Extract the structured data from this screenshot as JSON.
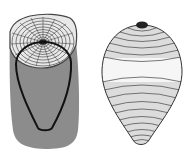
{
  "diagram": {
    "panels": [
      {
        "id": "log",
        "description": "Tree log cross-section showing growth rings with an outlined ovoid region inside the trunk",
        "colors": {
          "bark": "#8c8c8c",
          "rings_fill": "#e6e6e6",
          "ring_lines": "#333333",
          "outline": "#111111",
          "pith": "#222222"
        },
        "ring_count": 9,
        "ray_count": 16
      },
      {
        "id": "ovoid",
        "description": "Extracted teardrop / ovoid solid with horizontal contour bands and dark cap at top",
        "colors": {
          "fill_light": "#f4f4f4",
          "fill_band": "#dcdcdc",
          "contour": "#555555",
          "outline": "#333333",
          "cap": "#222222"
        },
        "contour_count": 16
      }
    ]
  }
}
